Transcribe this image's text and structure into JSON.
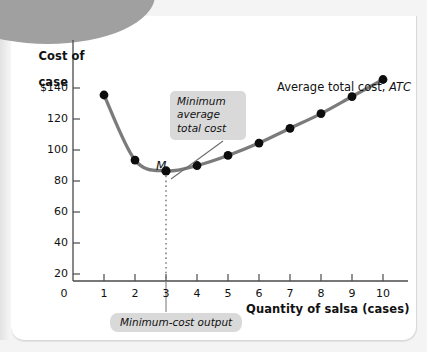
{
  "figure": {
    "y_axis_title_line1": "Cost of",
    "y_axis_title_line2": "case",
    "x_axis_title": "Quantity of salsa (cases)",
    "curve_label_text": "Average total cost, ",
    "curve_label_italic": "ATC",
    "minimum_point_label": "M",
    "callout_minimum_line1": "Minimum",
    "callout_minimum_line2": "average",
    "callout_minimum_line3": "total cost",
    "callout_output": "Minimum-cost output",
    "colors": {
      "curve": "#7b7b7b",
      "point": "#0d0d0d",
      "axis": "#4a4a4a",
      "callout_bg": "#d9d9d9",
      "panel_bg": "#ffffff",
      "page_bg": "#f4f4f4",
      "corner_decor": "#a0a0a0",
      "text": "#111111"
    }
  },
  "chart_data": {
    "type": "line",
    "title": "",
    "subtitle": "",
    "xlabel": "Quantity of salsa (cases)",
    "ylabel": "Cost of case",
    "x": [
      1,
      2,
      3,
      4,
      5,
      6,
      7,
      8,
      9,
      10
    ],
    "values": [
      120,
      78,
      71,
      74.5,
      81,
      89,
      98.5,
      108,
      119,
      130
    ],
    "series": [
      {
        "name": "Average total cost, ATC",
        "x": [
          1,
          2,
          3,
          4,
          5,
          6,
          7,
          8,
          9,
          10
        ],
        "values": [
          120,
          78,
          71,
          74.5,
          81,
          89,
          98.5,
          108,
          119,
          130
        ]
      }
    ],
    "xlim": [
      0,
      10.9
    ],
    "ylim": [
      0,
      150
    ],
    "x_ticks": [
      0,
      1,
      2,
      3,
      4,
      5,
      6,
      7,
      8,
      9,
      10
    ],
    "x_tick_labels": [
      "0",
      "1",
      "2",
      "3",
      "4",
      "5",
      "6",
      "7",
      "8",
      "9",
      "10"
    ],
    "y_ticks": [
      20,
      40,
      60,
      80,
      100,
      120,
      140
    ],
    "y_tick_labels": [
      "20",
      "40",
      "60",
      "80",
      "100",
      "120",
      "$140"
    ],
    "y_origin_label": "0",
    "grid": false,
    "legend": "none",
    "markers": "filled-circle",
    "annotations": [
      {
        "name": "minimum-average-total-cost",
        "text": "Minimum average total cost",
        "points_to_x": 3,
        "points_to_y": 71
      },
      {
        "name": "minimum-cost-output",
        "text": "Minimum-cost output",
        "points_to_x": 3,
        "points_to_y": 0
      },
      {
        "name": "minimum-point-marker",
        "text": "M",
        "points_to_x": 3,
        "points_to_y": 71
      }
    ],
    "reference_lines": [
      {
        "name": "minimum-output-dotted",
        "orientation": "vertical",
        "x": 3,
        "style": "dotted",
        "from_y": 0,
        "to_y": 71
      }
    ]
  }
}
